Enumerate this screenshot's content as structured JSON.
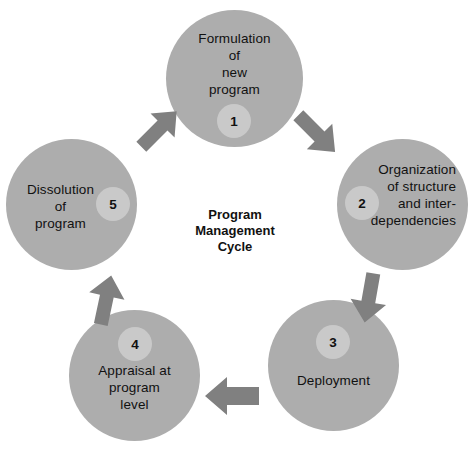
{
  "diagram": {
    "title": "Program Management Cycle",
    "center_text": "Program\nManagement\nCycle",
    "colors": {
      "background": "#ffffff",
      "node_fill": "#adadad",
      "badge_fill": "#c9c9c9",
      "arrow_fill": "#808080",
      "text": "#111111"
    },
    "nodes": [
      {
        "number": "1",
        "label": "Formulation\nof\nnew\nprogram"
      },
      {
        "number": "2",
        "label": "Organization\nof structure\nand inter-\ndependencies"
      },
      {
        "number": "3",
        "label": "Deployment"
      },
      {
        "number": "4",
        "label": "Appraisal at\nprogram\nlevel"
      },
      {
        "number": "5",
        "label": "Dissolution\nof\nprogram"
      }
    ],
    "arrows": [
      {
        "name": "arrow-5-to-1",
        "from": "5",
        "to": "1",
        "direction": "up-right"
      },
      {
        "name": "arrow-1-to-2",
        "from": "1",
        "to": "2",
        "direction": "down-right"
      },
      {
        "name": "arrow-2-to-3",
        "from": "2",
        "to": "3",
        "direction": "down"
      },
      {
        "name": "arrow-3-to-4",
        "from": "3",
        "to": "4",
        "direction": "left"
      },
      {
        "name": "arrow-4-to-5",
        "from": "4",
        "to": "5",
        "direction": "up"
      }
    ]
  }
}
